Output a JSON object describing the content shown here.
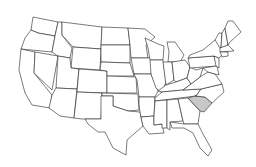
{
  "map": {
    "region": "United States",
    "highlighted_state": "South Carolina",
    "highlight_color": "#c8c8c8",
    "base_fill": "#ffffff",
    "stroke_color": "#222222"
  }
}
